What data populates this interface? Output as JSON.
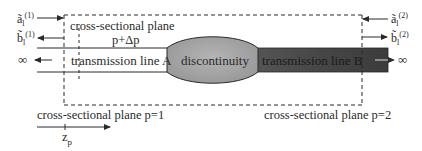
{
  "diagram": {
    "type": "two-port discontinuity between transmission lines",
    "left_port": {
      "incident_wave": "ã",
      "incident_sup": "(1)",
      "incident_sub": "l",
      "reflected_wave": "b̃",
      "reflected_sup": "(1)",
      "reflected_sub": "l",
      "infinity": "∞"
    },
    "right_port": {
      "incident_wave": "ã",
      "incident_sup": "(2)",
      "incident_sub": "l",
      "reflected_wave": "b̃",
      "reflected_sup": "(2)",
      "reflected_sub": "l",
      "infinity": "∞"
    },
    "labels": {
      "plane_top_line1": "cross-sectional plane",
      "plane_top_line2": "p+Δp",
      "line_a": "transmission line A",
      "discontinuity": "discontinuity",
      "line_b": "transmission line B",
      "plane_p1": "cross-sectional plane p=1",
      "plane_p2": "cross-sectional plane p=2",
      "axis": "z",
      "axis_sub": "p"
    },
    "colors": {
      "line_a_fill": "#ffffff",
      "discontinuity_fill": "#a8a8a8",
      "line_b_fill": "#4a4a4a",
      "stroke": "#2a2a2a"
    }
  }
}
